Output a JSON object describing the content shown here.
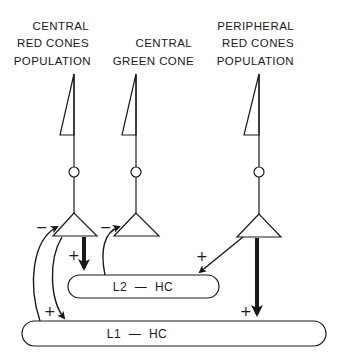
{
  "diagram": {
    "cells": [
      {
        "id": "central-red",
        "label_lines": [
          "CENTRAL",
          "RED CONES",
          "POPULATION"
        ]
      },
      {
        "id": "central-green",
        "label_lines": [
          "CENTRAL",
          "GREEN CONE"
        ]
      },
      {
        "id": "peripheral-red",
        "label_lines": [
          "PERIPHERAL",
          "RED CONES",
          "POPULATION"
        ]
      }
    ],
    "horizontal_cells": {
      "l2": {
        "label": "L2  —  HC"
      },
      "l1": {
        "label": "L1  —  HC"
      }
    },
    "signs": {
      "minus_red": "−",
      "minus_green": "−",
      "plus_red_to_l2": "+",
      "plus_periph_to_l2": "+",
      "plus_l1_to_red": "+",
      "plus_periph_to_l1": "+"
    },
    "colors": {
      "ink": "#1a1a1a",
      "background": "#ffffff"
    }
  }
}
